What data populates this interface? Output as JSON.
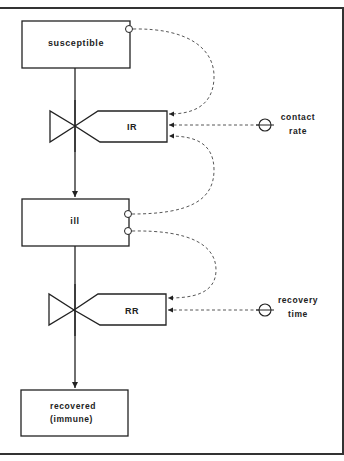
{
  "diagram": {
    "type": "stock-and-flow",
    "stocks": [
      {
        "id": "susceptible",
        "label": "susceptible"
      },
      {
        "id": "ill",
        "label": "ill"
      },
      {
        "id": "recovered",
        "label_line1": "recovered",
        "label_line2": "(immune)"
      }
    ],
    "flows": [
      {
        "id": "IR",
        "label": "IR",
        "from": "susceptible",
        "to": "ill"
      },
      {
        "id": "RR",
        "label": "RR",
        "from": "ill",
        "to": "recovered"
      }
    ],
    "parameters": [
      {
        "id": "contact_rate",
        "label_line1": "contact",
        "label_line2": "rate",
        "feeds": "IR"
      },
      {
        "id": "recovery_time",
        "label_line1": "recovery",
        "label_line2": "time",
        "feeds": "RR"
      }
    ],
    "information_links": [
      {
        "from": "susceptible",
        "to": "IR"
      },
      {
        "from": "ill",
        "to": "IR"
      },
      {
        "from": "ill",
        "to": "RR"
      },
      {
        "from": "contact_rate",
        "to": "IR"
      },
      {
        "from": "recovery_time",
        "to": "RR"
      }
    ]
  }
}
